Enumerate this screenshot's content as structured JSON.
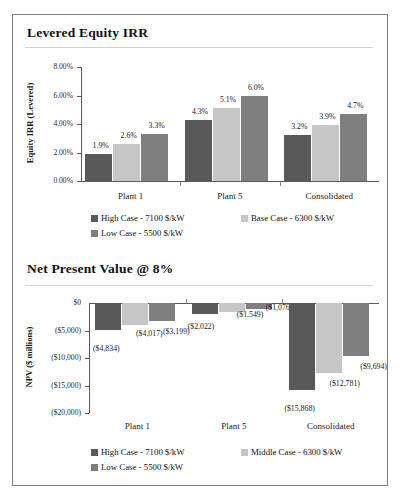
{
  "document": {
    "clipped_top_text": "",
    "frame_border_color": "#7d7d7d"
  },
  "series_colors": {
    "high_case": "#595959",
    "base_case": "#c6c6c6",
    "low_case": "#7f7f7f"
  },
  "irr_panel": {
    "title": "Levered Equity IRR",
    "legend": [
      {
        "label": "High Case - 7100 $/kW",
        "color": "#595959",
        "swatch_name": "legend-swatch-high-case"
      },
      {
        "label": "Base Case - 6300 $/kW",
        "color": "#c6c6c6",
        "swatch_name": "legend-swatch-base-case"
      },
      {
        "label": "Low Case - 5500 $/kW",
        "color": "#7f7f7f",
        "swatch_name": "legend-swatch-low-case"
      }
    ]
  },
  "npv_panel": {
    "title": "Net Present Value @ 8%",
    "legend": [
      {
        "label": "High Case - 7100 $/kW",
        "color": "#595959",
        "swatch_name": "legend-swatch-high-case"
      },
      {
        "label": "Middle Case - 6300 $/kW",
        "color": "#c6c6c6",
        "swatch_name": "legend-swatch-middle-case"
      },
      {
        "label": "Low Case - 5500 $/kW",
        "color": "#7f7f7f",
        "swatch_name": "legend-swatch-low-case"
      }
    ]
  },
  "chart_data": [
    {
      "id": "levered-equity-irr",
      "type": "bar",
      "title": "Levered Equity IRR",
      "xlabel": "",
      "ylabel": "Equity IRR (Levered)",
      "categories": [
        "Plant 1",
        "Plant 5",
        "Consolidated"
      ],
      "ylim": [
        0.0,
        8.0
      ],
      "yticks": [
        0.0,
        2.0,
        4.0,
        6.0,
        8.0
      ],
      "ytick_labels": [
        "0.00%",
        "2.00%",
        "4.00%",
        "6.00%",
        "8.00%"
      ],
      "grid": false,
      "legend_position": "bottom",
      "value_suffix": "%",
      "series": [
        {
          "name": "High Case - 7100 $/kW",
          "color": "#595959",
          "values": [
            1.9,
            4.3,
            3.2
          ],
          "labels": [
            "1.9%",
            "4.3%",
            "3.2%"
          ]
        },
        {
          "name": "Base Case - 6300 $/kW",
          "color": "#c6c6c6",
          "values": [
            2.6,
            5.1,
            3.9
          ],
          "labels": [
            "2.6%",
            "5.1%",
            "3.9%"
          ]
        },
        {
          "name": "Low Case - 5500 $/kW",
          "color": "#7f7f7f",
          "values": [
            3.3,
            6.0,
            4.7
          ],
          "labels": [
            "3.3%",
            "6.0%",
            "4.7%"
          ]
        }
      ]
    },
    {
      "id": "net-present-value-at-8-percent",
      "type": "bar",
      "title": "Net Present Value @ 8%",
      "xlabel": "",
      "ylabel": "NPV ($ millions)",
      "categories": [
        "Plant 1",
        "Plant 5",
        "Consolidated"
      ],
      "ylim": [
        -20000,
        0
      ],
      "yticks": [
        0,
        -5000,
        -10000,
        -15000,
        -20000
      ],
      "ytick_labels": [
        "$0",
        "($5,000)",
        "($10,000)",
        "($15,000)",
        "($20,000)"
      ],
      "grid": false,
      "legend_position": "bottom",
      "series": [
        {
          "name": "High Case - 7100 $/kW",
          "color": "#595959",
          "values": [
            -4834,
            -2022,
            -15868
          ],
          "labels": [
            "($4,834)",
            "($2,022)",
            "($15,868)"
          ]
        },
        {
          "name": "Middle Case - 6300 $/kW",
          "color": "#c6c6c6",
          "values": [
            -4017,
            -1549,
            -12781
          ],
          "labels": [
            "($4,017)",
            "($1,549)",
            "($12,781)"
          ]
        },
        {
          "name": "Low Case - 5500 $/kW",
          "color": "#7f7f7f",
          "values": [
            -3199,
            -1076,
            -9694
          ],
          "labels": [
            "($3,199)",
            "($1,076)",
            "($9,694)"
          ]
        }
      ]
    }
  ]
}
